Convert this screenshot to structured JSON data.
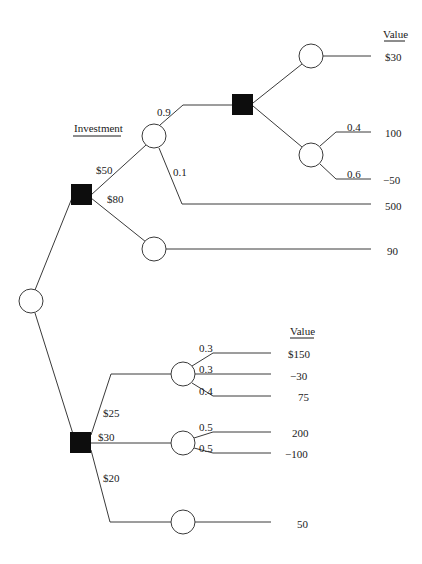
{
  "diagram": {
    "type": "decision-tree",
    "headers": {
      "investment": "Investment",
      "value_top": "Value",
      "value_bottom": "Value"
    },
    "upper_tree": {
      "investment_branches": [
        {
          "label": "$50",
          "probabilities": [
            {
              "label": "0.9",
              "leads_to": "decision",
              "outcomes": [
                {
                  "value": "$30"
                },
                {
                  "chance": [
                    {
                      "prob": "0.4",
                      "value": "100"
                    },
                    {
                      "prob": "0.6",
                      "value": "−50"
                    }
                  ]
                }
              ]
            },
            {
              "label": "0.1",
              "value": "500"
            }
          ]
        },
        {
          "label": "$80",
          "value": "90"
        }
      ]
    },
    "lower_tree": {
      "branches": [
        {
          "label": "$25",
          "outcomes": [
            {
              "prob": "0.3",
              "value": "$150"
            },
            {
              "prob": "0.3",
              "value": "−30"
            },
            {
              "prob": "0.4",
              "value": "75"
            }
          ]
        },
        {
          "label": "$30",
          "outcomes": [
            {
              "prob": "0.5",
              "value": "200"
            },
            {
              "prob": "0.5",
              "value": "−100"
            }
          ]
        },
        {
          "label": "$20",
          "value": "50"
        }
      ]
    }
  },
  "labels": {
    "b50": "$50",
    "b80": "$80",
    "p09": "0.9",
    "p01": "0.1",
    "p04": "0.4",
    "p06": "0.6",
    "v30": "$30",
    "v100": "100",
    "vm50": "−50",
    "v500": "500",
    "v90": "90",
    "b25": "$25",
    "b30": "$30",
    "b20": "$20",
    "p03a": "0.3",
    "p03b": "0.3",
    "p04b": "0.4",
    "p05a": "0.5",
    "p05b": "0.5",
    "v150": "$150",
    "vm30": "−30",
    "v75": "75",
    "v200": "200",
    "vm100": "−100",
    "v50": "50"
  },
  "colors": {
    "line": "#3a3a3a",
    "decision_node": "#0d0d0d",
    "chance_node_fill": "#ffffff"
  }
}
